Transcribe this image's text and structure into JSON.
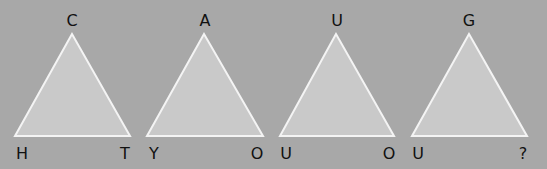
{
  "puzzle": {
    "triangles": [
      {
        "top": "C",
        "left": "H",
        "right": "T",
        "apex": [
          72,
          34
        ],
        "bl": [
          15,
          136
        ],
        "br": [
          130,
          136
        ]
      },
      {
        "top": "A",
        "left": "Y",
        "right": "O",
        "apex": [
          204,
          34
        ],
        "bl": [
          147,
          136
        ],
        "br": [
          263,
          136
        ]
      },
      {
        "top": "U",
        "left": "U",
        "right": "O",
        "apex": [
          336,
          34
        ],
        "bl": [
          280,
          136
        ],
        "br": [
          394,
          136
        ]
      },
      {
        "top": "G",
        "left": "U",
        "right": "?",
        "apex": [
          469,
          34
        ],
        "bl": [
          412,
          136
        ],
        "br": [
          527,
          136
        ]
      }
    ]
  },
  "colors": {
    "background": "#a8a8a8",
    "fill": "#c9c9c9",
    "stroke": "#f4f4f4",
    "text": "#111111"
  }
}
